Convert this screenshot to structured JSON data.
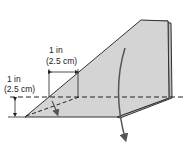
{
  "diagram": {
    "type": "origami-fold-step",
    "labels": {
      "top_dimension_line1": "1 in",
      "top_dimension_line2": "(2.5 cm)",
      "left_dimension_line1": "1 in",
      "left_dimension_line2": "(2.5 cm)"
    },
    "colors": {
      "paper_fill": "#d4d4d4",
      "paper_edge": "#333333",
      "fold_line": "#222222",
      "arrow": "#555555",
      "background": "#ffffff"
    }
  }
}
